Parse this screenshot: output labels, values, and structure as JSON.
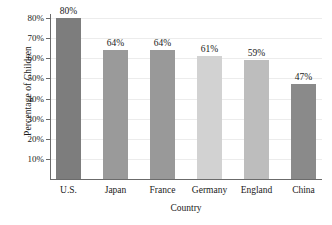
{
  "chart_data": {
    "type": "bar",
    "title": "",
    "xlabel": "Country",
    "ylabel": "Percentage of Children",
    "categories": [
      "U.S.",
      "Japan",
      "France",
      "Germany",
      "England",
      "China"
    ],
    "values": [
      80,
      64,
      64,
      61,
      59,
      47
    ],
    "value_labels": [
      "80%",
      "64%",
      "64%",
      "61%",
      "59%",
      "47%"
    ],
    "bar_colors": [
      "#7d7d7d",
      "#9a9a9a",
      "#999999",
      "#d2d2d2",
      "#bdbdbd",
      "#8a8a8a"
    ],
    "ylim": [
      0,
      80
    ],
    "ytick_values": [
      10,
      20,
      30,
      40,
      50,
      60,
      70,
      80
    ],
    "ytick_labels": [
      "10%",
      "20%",
      "30%",
      "40%",
      "50%",
      "60%",
      "70%",
      "80%"
    ],
    "grid": true,
    "grid_color": "#ececec",
    "legend": null,
    "axis_color": "#6b6b6b"
  }
}
